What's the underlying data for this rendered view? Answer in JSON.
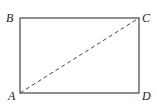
{
  "diagram": {
    "type": "rectangle-with-diagonal",
    "vertices": [
      {
        "label": "A",
        "x": 20,
        "y": 93
      },
      {
        "label": "B",
        "x": 20,
        "y": 18
      },
      {
        "label": "C",
        "x": 139,
        "y": 18
      },
      {
        "label": "D",
        "x": 139,
        "y": 93
      }
    ],
    "edges": [
      {
        "from": "A",
        "to": "B",
        "style": "solid"
      },
      {
        "from": "B",
        "to": "C",
        "style": "solid"
      },
      {
        "from": "C",
        "to": "D",
        "style": "solid"
      },
      {
        "from": "D",
        "to": "A",
        "style": "solid"
      },
      {
        "from": "A",
        "to": "C",
        "style": "dashed"
      }
    ],
    "labels": {
      "A": "A",
      "B": "B",
      "C": "C",
      "D": "D"
    },
    "colors": {
      "stroke": "#444444",
      "label": "#222222"
    }
  }
}
